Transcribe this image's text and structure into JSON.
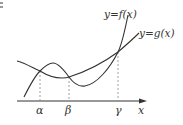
{
  "diagram": {
    "type": "function-graph",
    "curves": [
      {
        "name": "f",
        "label": "y=f(x)",
        "description": "cubic-like curve rising, local max, local min, then steep rise"
      },
      {
        "name": "g",
        "label": "y=g(x)",
        "description": "convex curve with minimum near beta"
      }
    ],
    "axis": {
      "x_label": "x"
    },
    "intersections": [
      {
        "label": "α"
      },
      {
        "label": "β"
      },
      {
        "label": "γ"
      }
    ],
    "colors": {
      "curve": "#333333",
      "axis": "#333333",
      "guide": "#888888"
    }
  }
}
